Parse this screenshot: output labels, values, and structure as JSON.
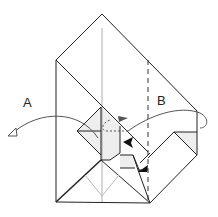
{
  "diagram": {
    "type": "origami-fold-step",
    "labels": {
      "a": "A",
      "b": "B"
    },
    "colors": {
      "line": "#222222",
      "fill_shade": "#eeeeee",
      "arrow_curve": "#555555",
      "valley_guide": "#bbbbbb"
    }
  }
}
